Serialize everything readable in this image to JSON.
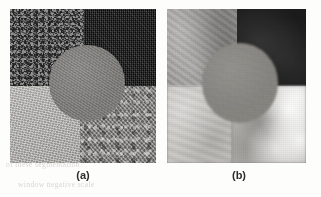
{
  "figure": {
    "panels": [
      {
        "id": "a",
        "caption": "(a)",
        "description": "original textured composite image",
        "quadrants": [
          {
            "position": "top-left",
            "name": "dark-speckled-texture",
            "color": "#4a4a4a"
          },
          {
            "position": "top-right",
            "name": "near-black-weave-texture",
            "color": "#171717"
          },
          {
            "position": "bottom-left",
            "name": "light-fine-texture",
            "color": "#b4b2ae"
          },
          {
            "position": "bottom-right",
            "name": "mid-gray-coarse-texture",
            "color": "#8d8b88"
          }
        ],
        "disc": {
          "name": "central-gray-disc",
          "color": "#7e7c79"
        }
      },
      {
        "id": "b",
        "caption": "(b)",
        "description": "smoothed / blurred version of the same image",
        "quadrants": [
          {
            "position": "top-left",
            "name": "blurred-mid-gray-region",
            "color": "#9d9b98"
          },
          {
            "position": "top-right",
            "name": "blurred-near-black-region",
            "color": "#1b1b1b"
          },
          {
            "position": "bottom-left",
            "name": "blurred-light-gray-region",
            "color": "#c9c7c3"
          },
          {
            "position": "bottom-right",
            "name": "blurred-bright-blotchy-region",
            "color": "#b9b7b3"
          }
        ],
        "disc": {
          "name": "central-gray-disc",
          "color": "#86847f"
        }
      }
    ]
  },
  "background": {
    "page_color": "#fdfdfc",
    "ghost_text": [
      "of these        segmentation",
      "window          negative scale"
    ]
  }
}
